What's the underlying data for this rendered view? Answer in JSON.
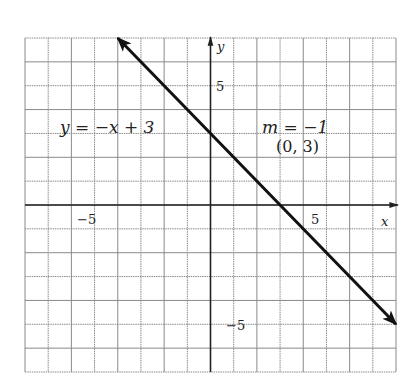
{
  "chart_data": {
    "type": "line",
    "title": "",
    "xlabel": "x",
    "ylabel": "y",
    "xlim": [
      -8,
      8
    ],
    "ylim": [
      -7,
      7
    ],
    "grid": true,
    "x_ticks_labeled": [
      {
        "value": -5,
        "label": "−5"
      },
      {
        "value": 5,
        "label": "5"
      }
    ],
    "y_ticks_labeled": [
      {
        "value": 5,
        "label": "5"
      },
      {
        "value": -5,
        "label": "−5"
      }
    ],
    "series": [
      {
        "name": "y = -x + 3",
        "equation": "y = -x + 3",
        "slope": -1,
        "intercept": 3,
        "x": [
          -4,
          8
        ],
        "y": [
          7,
          -5
        ],
        "arrows": "both",
        "color": "#111111"
      }
    ],
    "annotations": [
      {
        "text": "y = −x + 3",
        "x": -5.5,
        "y": 3.5
      },
      {
        "text": "m = −1",
        "x": 4,
        "y": 3.5
      },
      {
        "text": "(0, 3)",
        "x": 4,
        "y": 2.5
      }
    ]
  },
  "labels": {
    "equation": "y = −x + 3",
    "slope": "m = −1",
    "point": "(0, 3)",
    "x_axis": "x",
    "y_axis": "y",
    "x_tick_neg5": "−5",
    "x_tick_5": "5",
    "y_tick_5": "5",
    "y_tick_neg5": "−5"
  },
  "colors": {
    "grid": "#8a8a8a",
    "axis": "#222222",
    "line": "#111111",
    "text": "#222222"
  }
}
